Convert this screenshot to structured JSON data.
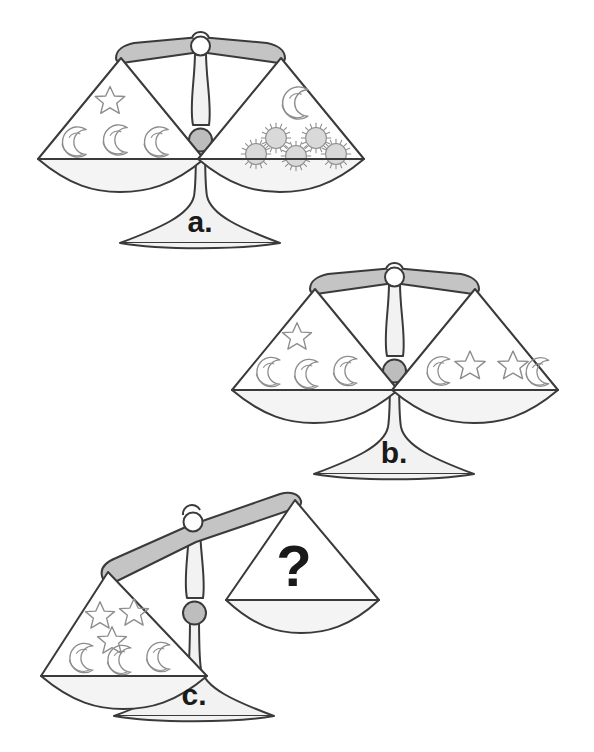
{
  "page": {
    "background_color": "#ffffff",
    "width": 594,
    "height": 752
  },
  "colors": {
    "outline": "#3a3a3a",
    "beam_fill": "#c4c4c4",
    "pan_fill": "#f4f4f4",
    "post_fill": "#f2f2f2",
    "knob_fill": "#bdbdbd",
    "sun_fill": "#d9d9d9",
    "symbol_stroke": "#8d8d8d",
    "text": "#1a1a1a"
  },
  "scales": [
    {
      "id": "scale-a",
      "label": "a.",
      "state": "balanced",
      "tilt_degrees": 0,
      "left_pan": {
        "name": "left-pan",
        "contents": [
          {
            "symbol": "star",
            "count": 1
          },
          {
            "symbol": "moon",
            "count": 3
          }
        ]
      },
      "right_pan": {
        "name": "right-pan",
        "contents": [
          {
            "symbol": "moon",
            "count": 1
          },
          {
            "symbol": "sun",
            "count": 5
          }
        ]
      }
    },
    {
      "id": "scale-b",
      "label": "b.",
      "state": "balanced",
      "tilt_degrees": 0,
      "left_pan": {
        "name": "left-pan",
        "contents": [
          {
            "symbol": "star",
            "count": 1
          },
          {
            "symbol": "moon",
            "count": 3
          }
        ]
      },
      "right_pan": {
        "name": "right-pan",
        "contents": [
          {
            "symbol": "star",
            "count": 2
          },
          {
            "symbol": "moon",
            "count": 2
          }
        ]
      }
    },
    {
      "id": "scale-c",
      "label": "c.",
      "state": "tilted-left",
      "tilt_degrees": -13,
      "left_pan": {
        "name": "left-pan",
        "contents": [
          {
            "symbol": "star",
            "count": 3
          },
          {
            "symbol": "moon",
            "count": 3
          }
        ]
      },
      "right_pan": {
        "name": "right-pan",
        "unknown_marker": "?",
        "contents": []
      }
    }
  ],
  "symbol_glyphs": {
    "star": "star-icon",
    "moon": "crescent-moon-icon",
    "sun": "sun-icon",
    "question": "question-mark-icon"
  }
}
